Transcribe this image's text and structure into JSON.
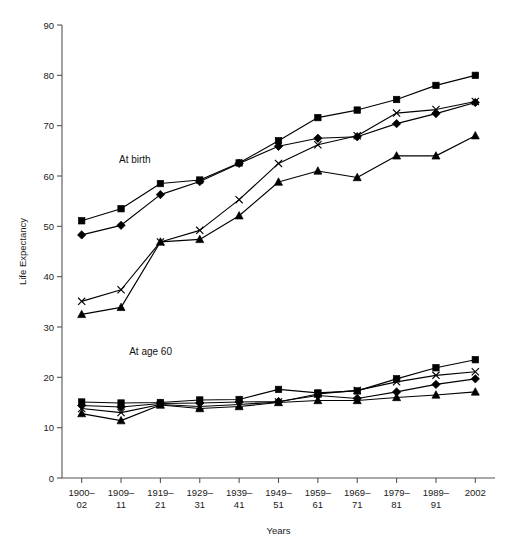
{
  "chart_data": {
    "type": "line",
    "title": "",
    "xlabel": "Years",
    "ylabel": "Life Expectancy",
    "ylim": [
      0,
      90
    ],
    "ytick_step": 10,
    "yticks": [
      0,
      10,
      20,
      30,
      40,
      50,
      60,
      70,
      80,
      90
    ],
    "grid": false,
    "legend_position": "none",
    "categories": [
      "1900–\n02",
      "1909–\n11",
      "1919–\n21",
      "1929–\n31",
      "1939–\n41",
      "1949–\n51",
      "1959–\n61",
      "1969–\n71",
      "1979–\n81",
      "1989–\n91",
      "2002"
    ],
    "categories_line1": [
      "1900–",
      "1909–",
      "1919–",
      "1929–",
      "1939–",
      "1949–",
      "1959–",
      "1969–",
      "1979–",
      "1989–",
      "2002"
    ],
    "categories_line2": [
      "02",
      "11",
      "21",
      "31",
      "41",
      "51",
      "61",
      "71",
      "81",
      "91",
      ""
    ],
    "annotations": [
      {
        "text": "At birth",
        "x_category_index": 1.35,
        "y_value": 62.5
      },
      {
        "text": "At age 60",
        "x_category_index": 1.75,
        "y_value": 24.5
      }
    ],
    "series": [
      {
        "name": "At birth – square",
        "group": "At birth",
        "marker": "square",
        "values": [
          51.1,
          53.5,
          58.5,
          59.2,
          62.6,
          67.0,
          71.6,
          73.1,
          75.2,
          78.0,
          80.0
        ]
      },
      {
        "name": "At birth – diamond",
        "group": "At birth",
        "marker": "diamond",
        "values": [
          48.3,
          50.2,
          56.3,
          58.9,
          62.5,
          65.9,
          67.5,
          67.8,
          70.4,
          72.4,
          74.6
        ]
      },
      {
        "name": "At birth – cross",
        "group": "At birth",
        "marker": "cross",
        "values": [
          35.1,
          37.4,
          46.9,
          49.2,
          55.3,
          62.5,
          66.2,
          68.0,
          72.5,
          73.2,
          74.8
        ]
      },
      {
        "name": "At birth – triangle",
        "group": "At birth",
        "marker": "triangle",
        "values": [
          32.5,
          33.9,
          46.9,
          47.4,
          52.1,
          58.8,
          61.0,
          59.7,
          64.0,
          64.0,
          68.0
        ]
      },
      {
        "name": "At age 60 – square",
        "group": "At age 60",
        "marker": "square",
        "values": [
          15.1,
          14.9,
          15.0,
          15.5,
          15.6,
          17.6,
          16.9,
          17.3,
          19.7,
          21.9,
          23.5
        ]
      },
      {
        "name": "At age 60 – diamond",
        "group": "At age 60",
        "marker": "diamond",
        "values": [
          14.4,
          14.1,
          14.8,
          14.9,
          15.1,
          15.2,
          16.4,
          15.8,
          17.1,
          18.6,
          19.7
        ]
      },
      {
        "name": "At age 60 – cross",
        "group": "At age 60",
        "marker": "cross",
        "values": [
          13.8,
          13.0,
          14.6,
          14.2,
          14.6,
          15.1,
          16.7,
          17.4,
          19.1,
          20.4,
          21.1
        ]
      },
      {
        "name": "At age 60 – triangle",
        "group": "At age 60",
        "marker": "triangle",
        "values": [
          12.8,
          11.4,
          14.5,
          13.8,
          14.2,
          15.0,
          15.4,
          15.4,
          16.0,
          16.5,
          17.1
        ]
      }
    ]
  }
}
